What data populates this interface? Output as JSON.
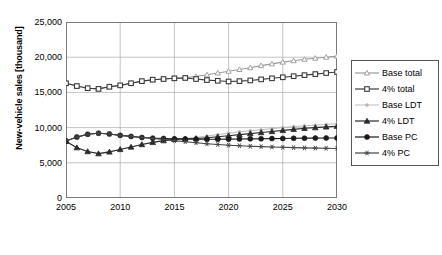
{
  "chart_data": {
    "type": "line",
    "title": "",
    "xlabel": "",
    "ylabel": "New-vehicle sales [thousand]",
    "xlim": [
      2005,
      2030
    ],
    "ylim": [
      0,
      25000
    ],
    "xticks": [
      "2005",
      "2010",
      "2015",
      "2020",
      "2025",
      "2030"
    ],
    "yticks": [
      "0",
      "5,000",
      "10,000",
      "15,000",
      "20,000",
      "25,000"
    ],
    "grid": true,
    "legend_position": "right",
    "x": [
      2005,
      2006,
      2007,
      2008,
      2009,
      2010,
      2011,
      2012,
      2013,
      2014,
      2015,
      2016,
      2017,
      2018,
      2019,
      2020,
      2021,
      2022,
      2023,
      2024,
      2025,
      2026,
      2027,
      2028,
      2029,
      2030
    ],
    "series": [
      {
        "name": "Base total",
        "marker": "open-triangle",
        "color": "#9a9a9a",
        "values": [
          16300,
          15900,
          15600,
          15500,
          15800,
          16000,
          16300,
          16600,
          16800,
          16900,
          17000,
          17100,
          17250,
          17500,
          17750,
          18000,
          18250,
          18500,
          18800,
          19050,
          19300,
          19500,
          19700,
          19850,
          20000,
          20150
        ]
      },
      {
        "name": "4% total",
        "marker": "open-square",
        "color": "#3b3b3b",
        "values": [
          16300,
          15900,
          15600,
          15500,
          15800,
          16000,
          16300,
          16600,
          16800,
          16900,
          17000,
          17050,
          16900,
          16750,
          16650,
          16550,
          16600,
          16700,
          16850,
          17000,
          17150,
          17300,
          17450,
          17600,
          17750,
          17900
        ]
      },
      {
        "name": "Base LDT",
        "marker": "small-dot",
        "color": "#b5b5b5",
        "values": [
          8050,
          7150,
          6600,
          6300,
          6550,
          6900,
          7250,
          7600,
          7900,
          8150,
          8350,
          8450,
          8600,
          8800,
          9000,
          9200,
          9400,
          9550,
          9700,
          9850,
          10000,
          10150,
          10250,
          10350,
          10450,
          10550
        ]
      },
      {
        "name": "4% LDT",
        "marker": "filled-triangle",
        "color": "#2b2b2b",
        "values": [
          8050,
          7150,
          6600,
          6300,
          6550,
          6900,
          7250,
          7600,
          7900,
          8150,
          8350,
          8400,
          8450,
          8550,
          8700,
          8850,
          9000,
          9150,
          9300,
          9450,
          9600,
          9750,
          9900,
          10000,
          10100,
          10200
        ]
      },
      {
        "name": "Base PC",
        "marker": "filled-circle",
        "color": "#1a1a1a",
        "values": [
          8100,
          8650,
          9050,
          9200,
          9100,
          8900,
          8750,
          8600,
          8500,
          8450,
          8400,
          8380,
          8360,
          8350,
          8350,
          8360,
          8380,
          8400,
          8420,
          8440,
          8460,
          8480,
          8500,
          8510,
          8520,
          8530
        ]
      },
      {
        "name": "4% PC",
        "marker": "asterisk",
        "color": "#444444",
        "values": [
          8100,
          8650,
          9050,
          9200,
          9100,
          8900,
          8750,
          8600,
          8450,
          8300,
          8150,
          8000,
          7850,
          7700,
          7600,
          7500,
          7420,
          7350,
          7300,
          7250,
          7200,
          7160,
          7120,
          7090,
          7060,
          7040
        ]
      }
    ]
  },
  "legend": {
    "items": [
      {
        "label": "Base total"
      },
      {
        "label": "4% total"
      },
      {
        "label": "Base LDT"
      },
      {
        "label": "4% LDT"
      },
      {
        "label": "Base PC"
      },
      {
        "label": "4% PC"
      }
    ]
  }
}
